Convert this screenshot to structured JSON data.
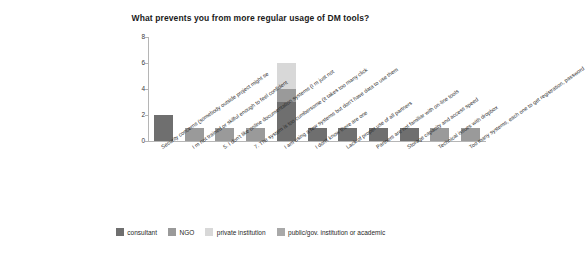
{
  "chart_data": {
    "type": "bar",
    "title": "What prevents you from more regular usage of DM tools?",
    "xlabel": "",
    "ylabel": "",
    "ylim": [
      0,
      8
    ],
    "yticks": [
      0,
      2,
      4,
      6,
      8
    ],
    "grid": false,
    "stacked": true,
    "legend_position": "bottom",
    "categories": [
      "Security concerns (somebody outside project might se",
      "I     m not trained or skilful enough to feel confident",
      "5. I don't like online documentation systems (I      m just not",
      "7. The system is too cumbersome (it takes too many click",
      "I am using a few systems but don't have data to use them",
      "I don't know there are one",
      "Lack of proper use of all partners",
      "Partners are not familiar with on-line tools",
      "Storage capacity and access speed",
      "Technical issues with dropbox",
      "Too many systems, each one to get registration, password"
    ],
    "series": [
      {
        "name": "consultant",
        "color": "#6f6f6f",
        "values": [
          2,
          0,
          0,
          0,
          3,
          1,
          1,
          1,
          1,
          0,
          0
        ]
      },
      {
        "name": "NGO",
        "color": "#9a9a9a",
        "values": [
          0,
          1,
          1,
          1,
          1,
          0,
          0,
          0,
          0,
          1,
          1
        ]
      },
      {
        "name": "private institution",
        "color": "#d8d8d8",
        "values": [
          0,
          0,
          0,
          0,
          2,
          0,
          0,
          0,
          0,
          0,
          0
        ]
      },
      {
        "name": "public/gov. institution or academic",
        "color": "#a9a9a9",
        "values": [
          0,
          0,
          0,
          0,
          0,
          0,
          0,
          0,
          0,
          0,
          0
        ]
      }
    ],
    "totals": [
      2,
      1,
      1,
      1,
      6,
      1,
      1,
      1,
      1,
      1,
      1
    ]
  },
  "legend": [
    {
      "label": "consultant",
      "color": "#6f6f6f"
    },
    {
      "label": "NGO",
      "color": "#9a9a9a"
    },
    {
      "label": "private institution",
      "color": "#d8d8d8"
    },
    {
      "label": "public/gov. institution or academic",
      "color": "#a9a9a9"
    }
  ]
}
